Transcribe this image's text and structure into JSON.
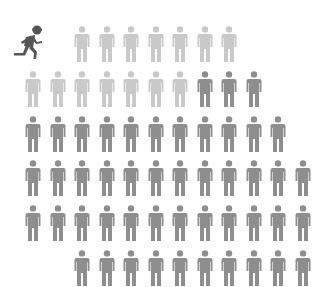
{
  "chart_data": {
    "type": "pictograph",
    "title": "",
    "icon": "person",
    "columns": 12,
    "column_spacing_px": 24.5,
    "row_spacing_px": 44.8,
    "categories": [
      "runner",
      "light",
      "dark"
    ],
    "series": [
      {
        "name": "runner",
        "color": "#555555",
        "count": 1
      },
      {
        "name": "light",
        "color": "#c9c9c9",
        "count": 14
      },
      {
        "name": "dark",
        "color": "#8e8e8e",
        "count": 48
      }
    ],
    "rows": [
      {
        "start_col": 2,
        "cells": [
          "light",
          "light",
          "light",
          "light",
          "light",
          "light",
          "light"
        ]
      },
      {
        "start_col": 0,
        "cells": [
          "light",
          "light",
          "light",
          "light",
          "light",
          "light",
          "light",
          "dark",
          "dark",
          "dark"
        ]
      },
      {
        "start_col": 0,
        "cells": [
          "dark",
          "dark",
          "dark",
          "dark",
          "dark",
          "dark",
          "dark",
          "dark",
          "dark",
          "dark",
          "dark"
        ]
      },
      {
        "start_col": 0,
        "cells": [
          "dark",
          "dark",
          "dark",
          "dark",
          "dark",
          "dark",
          "dark",
          "dark",
          "dark",
          "dark",
          "dark",
          "dark"
        ]
      },
      {
        "start_col": 0,
        "cells": [
          "dark",
          "dark",
          "dark",
          "dark",
          "dark",
          "dark",
          "dark",
          "dark",
          "dark",
          "dark",
          "dark",
          "dark"
        ]
      },
      {
        "start_col": 2,
        "cells": [
          "dark",
          "dark",
          "dark",
          "dark",
          "dark",
          "dark",
          "dark",
          "dark",
          "dark",
          "dark"
        ],
        "partially_visible": true
      }
    ]
  },
  "colors": {
    "background": "#ffffff",
    "runner": "#555555",
    "light": "#c9c9c9",
    "dark": "#8e8e8e"
  },
  "icons": {
    "runner": "running-person-icon",
    "person": "standing-person-icon"
  }
}
